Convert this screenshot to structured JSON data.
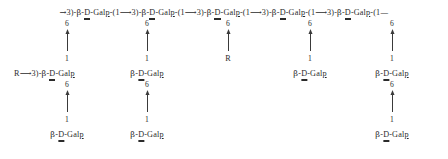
{
  "diagram": {
    "kind": "polysaccharide-repeating-unit",
    "backbone": {
      "text": "→3)-β-D-Galp-(1→3)-β-D-Galp-(1→3)-β-D-Galp-(1→3)-β-D-Galp-(1→3)-β-D-Galp-(1—",
      "start_arrow": "→3)-",
      "residue": "β-D-Galp",
      "linkage": "-(1→3)-",
      "end_linkage": "-(1—",
      "repeat_count": 5,
      "linkage_type": "(1→3)",
      "anomeric_config": "β",
      "absolute_config": "D",
      "sugar": "Gal",
      "ring_form": "p"
    },
    "branch_position_label": "6",
    "anomeric_position_label": "1",
    "link_arrow_icon": "arrow-up-icon",
    "columns": [
      {
        "id": "col-1",
        "x": 67,
        "backbone_position": "6",
        "level2": {
          "label": "R⟶3)-β-D-Galp",
          "prefix": "R",
          "prefix_arrow": "⟶",
          "linkage_tail": "3)-",
          "residue": "β-D-Galp",
          "anchor": "left",
          "anchor_x": 14,
          "position_label": "6",
          "anomeric_label": "1"
        },
        "level3": {
          "label": "β-D-Galp",
          "residue": "β-D-Galp",
          "anomeric_label": "1"
        }
      },
      {
        "id": "col-2",
        "x": 147,
        "backbone_position": "6",
        "level2": {
          "label": "β-D-Galp",
          "residue": "β-D-Galp",
          "anchor": "center",
          "position_label": "6",
          "anomeric_label": "1"
        },
        "level3": {
          "label": "β-D-Galp",
          "residue": "β-D-Galp",
          "anomeric_label": "1"
        }
      },
      {
        "id": "col-3",
        "x": 228,
        "backbone_position": "6",
        "level2": {
          "label": "R",
          "residue": "R",
          "anchor": "center",
          "is_rgroup": true,
          "anomeric_label": "R"
        },
        "level3": null
      },
      {
        "id": "col-4",
        "x": 310,
        "backbone_position": "6",
        "level2": {
          "label": "β-D-Galp",
          "residue": "β-D-Galp",
          "anchor": "center",
          "anomeric_label": "1"
        },
        "level3": null
      },
      {
        "id": "col-5",
        "x": 392,
        "backbone_position": "6",
        "level2": {
          "label": "β-D-Galp",
          "residue": "β-D-Galp",
          "anchor": "center",
          "position_label": "6",
          "anomeric_label": "1"
        },
        "level3": {
          "label": "β-D-Galp",
          "residue": "β-D-Galp",
          "anomeric_label": "1"
        }
      }
    ],
    "parts": {
      "beta": "β",
      "dash": "-",
      "d_letter": "D",
      "gal": "Gal",
      "p_letter": "p",
      "open_paren": "(",
      "close_paren": ")",
      "one": "1",
      "three": "3",
      "arrow_right": "→",
      "arrow_right_long": "⟶",
      "em_dash": "—",
      "r_letter": "R"
    }
  }
}
